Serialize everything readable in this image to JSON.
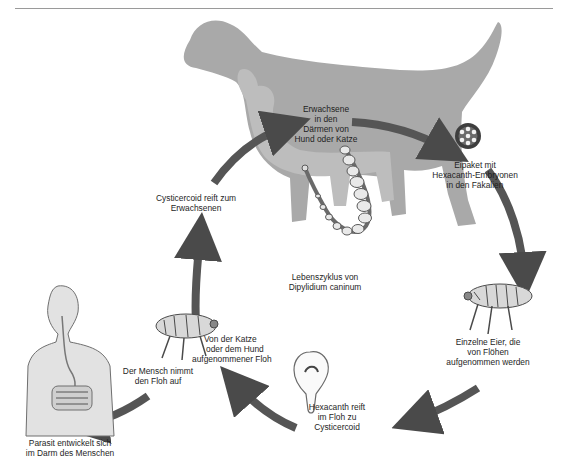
{
  "figure": {
    "title": "Lebenszyklus von Dipylidium caninum",
    "center_label": [
      "Lebenszyklus von",
      "Dipylidium caninum"
    ],
    "stages": [
      {
        "id": "adult-in-host",
        "lines": [
          "Erwachsene",
          "in den",
          "Därmen von",
          "Hund oder Katze"
        ]
      },
      {
        "id": "egg-packet",
        "lines": [
          "Eipaket mit",
          "Hexacanth-Embryonen",
          "in den Fäkalien"
        ]
      },
      {
        "id": "eggs-eaten-by-flea-larvae",
        "lines": [
          "Einzelne Eier, die",
          "von Flöhen",
          "aufgenommen werden"
        ]
      },
      {
        "id": "hexacanth-in-flea",
        "lines": [
          "Hexacanth reift",
          "im Floh zu",
          "Cysticercoid"
        ]
      },
      {
        "id": "flea-ingested-by-pet",
        "lines": [
          "Von der Katze",
          "oder dem Hund",
          "aufgenommener Floh"
        ]
      },
      {
        "id": "human-ingests-flea",
        "lines": [
          "Der Mensch nimmt",
          "den Floh auf"
        ]
      },
      {
        "id": "human-infection",
        "lines": [
          "Parasit entwickelt sich",
          "im Darm des Menschen"
        ]
      },
      {
        "id": "cysticercoid-matures",
        "lines": [
          "Cysticercoid reift zum",
          "Erwachsenen"
        ]
      }
    ],
    "colors": {
      "silhouette": "#a9a9a9",
      "arrow": "#555555",
      "arrow_edge": "#3a3a3a",
      "human_fill": "#e2e2e2",
      "human_line": "#6f6f6f",
      "rule": "#9a9a9a"
    }
  }
}
